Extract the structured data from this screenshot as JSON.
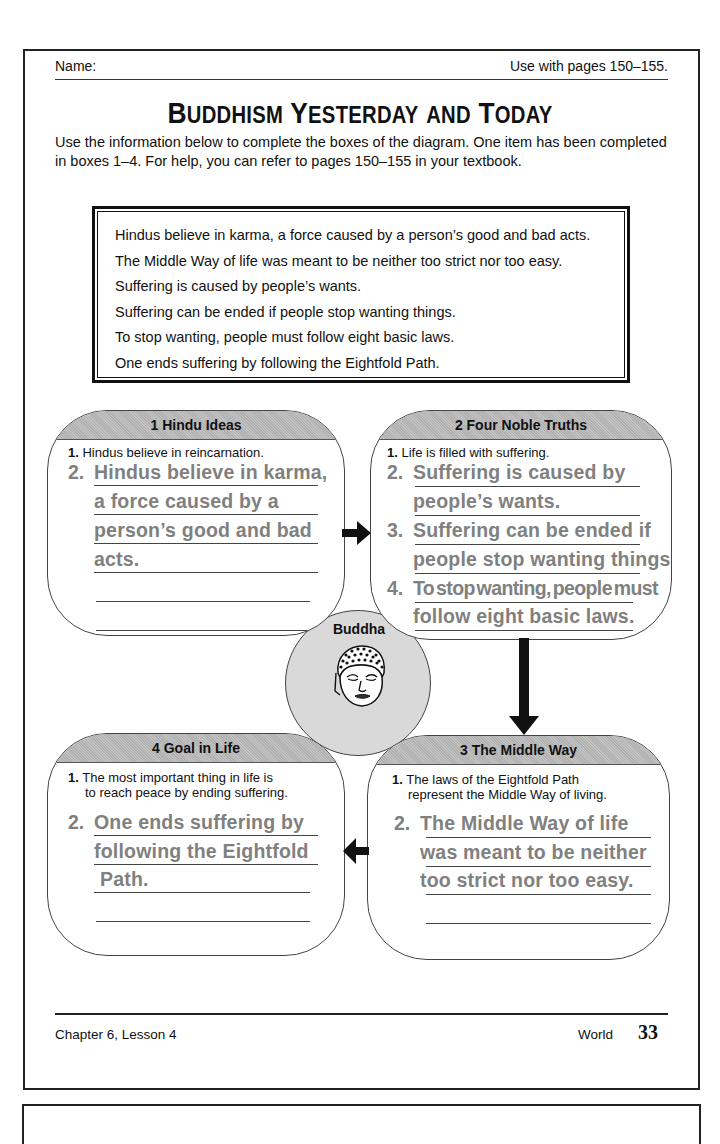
{
  "header": {
    "name_label": "Name:",
    "pages_ref": "Use with pages 150–155."
  },
  "title": {
    "w1_first": "B",
    "w1_rest": "UDDHISM",
    "w2_first": "Y",
    "w2_rest": "ESTERDAY",
    "w3": "AND",
    "w4_first": "T",
    "w4_rest": "ODAY",
    "full": "Buddhism Yesterday and Today"
  },
  "instructions": "Use the information below to complete the boxes of the diagram. One item has been completed in boxes 1–4. For help, you can refer to pages 150–155 in your textbook.",
  "info_box": {
    "items": [
      "Hindus believe in karma, a force caused by a person’s good and bad acts.",
      "The Middle Way of life was meant to be neither too strict nor too easy.",
      "Suffering is caused by people’s wants.",
      "Suffering can be ended if people stop wanting things.",
      "To stop wanting, people must follow eight basic laws.",
      "One ends suffering by following the Eightfold Path."
    ]
  },
  "diagram": {
    "center": {
      "label": "Buddha",
      "icon": "buddha-head-icon"
    },
    "boxes": [
      {
        "title": "1  Hindu Ideas",
        "given_num": "1.",
        "given_text": "Hindus believe in reincarnation.",
        "answers": [
          {
            "num": "2.",
            "lines": [
              "Hindus believe in karma,",
              "a force caused by a",
              "person’s good and bad",
              "acts."
            ]
          }
        ]
      },
      {
        "title": "2  Four Noble Truths",
        "given_num": "1.",
        "given_text": "Life is filled with suffering.",
        "answers": [
          {
            "num": "2.",
            "lines": [
              "Suffering is caused by",
              "people’s wants."
            ]
          },
          {
            "num": "3.",
            "lines": [
              "Suffering can be ended if",
              "people stop wanting things."
            ]
          },
          {
            "num": "4.",
            "lines": [
              "To stop wanting, people must",
              "follow eight basic laws."
            ]
          }
        ]
      },
      {
        "title": "3  The Middle Way",
        "given_num": "1.",
        "given_text_l1": "The laws of the Eightfold Path",
        "given_text_l2": "represent the Middle Way of living.",
        "answers": [
          {
            "num": "2.",
            "lines": [
              "The Middle Way of life",
              "was meant to be neither",
              "too strict nor too easy."
            ]
          }
        ]
      },
      {
        "title": "4  Goal in Life",
        "given_num": "1.",
        "given_text_l1": "The most important thing in life is",
        "given_text_l2": "to reach peace by ending suffering.",
        "answers": [
          {
            "num": "2.",
            "lines": [
              "One ends suffering by",
              "following the Eightfold",
              "Path."
            ]
          }
        ]
      }
    ],
    "arrows": [
      "box1-to-box2 (right)",
      "box2-to-box3 (down)",
      "box3-to-box4 (left)"
    ]
  },
  "footer": {
    "chapter": "Chapter 6, Lesson 4",
    "subject": "World",
    "page_number": "33"
  },
  "colors": {
    "answer_text": "#808080",
    "header_band": "#b5b5b5",
    "buddha_circle": "#d9d9d9",
    "ink": "#111111"
  }
}
